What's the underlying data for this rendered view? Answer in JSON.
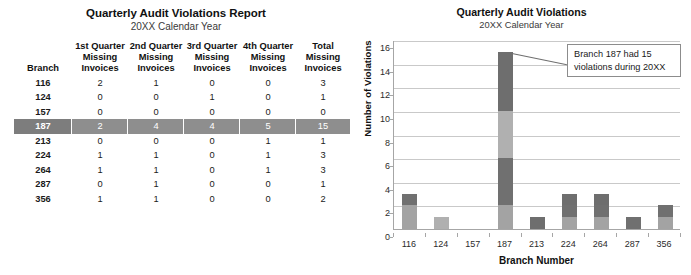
{
  "table_report": {
    "title": "Quarterly Audit Violations Report",
    "subtitle": "20XX Calendar Year",
    "columns": [
      {
        "line1": "",
        "line2": "",
        "line3": "Branch"
      },
      {
        "line1": "1st Quarter",
        "line2": "Missing",
        "line3": "Invoices"
      },
      {
        "line1": "2nd Quarter",
        "line2": "Missing",
        "line3": "Invoices"
      },
      {
        "line1": "3rd Quarter",
        "line2": "Missing",
        "line3": "Invoices"
      },
      {
        "line1": "4th Quarter",
        "line2": "Missing",
        "line3": "Invoices"
      },
      {
        "line1": "Total",
        "line2": "Missing",
        "line3": "Invoices"
      }
    ],
    "rows": [
      {
        "branch": "116",
        "q1": "2",
        "q2": "1",
        "q3": "0",
        "q4": "0",
        "total": "3",
        "highlighted": false
      },
      {
        "branch": "124",
        "q1": "0",
        "q2": "0",
        "q3": "1",
        "q4": "0",
        "total": "1",
        "highlighted": false
      },
      {
        "branch": "157",
        "q1": "0",
        "q2": "0",
        "q3": "0",
        "q4": "0",
        "total": "0",
        "highlighted": false
      },
      {
        "branch": "187",
        "q1": "2",
        "q2": "4",
        "q3": "4",
        "q4": "5",
        "total": "15",
        "highlighted": true
      },
      {
        "branch": "213",
        "q1": "0",
        "q2": "0",
        "q3": "0",
        "q4": "1",
        "total": "1",
        "highlighted": false
      },
      {
        "branch": "224",
        "q1": "1",
        "q2": "1",
        "q3": "0",
        "q4": "1",
        "total": "3",
        "highlighted": false
      },
      {
        "branch": "264",
        "q1": "1",
        "q2": "1",
        "q3": "0",
        "q4": "1",
        "total": "3",
        "highlighted": false
      },
      {
        "branch": "287",
        "q1": "0",
        "q2": "1",
        "q3": "0",
        "q4": "0",
        "total": "1",
        "highlighted": false
      },
      {
        "branch": "356",
        "q1": "1",
        "q2": "1",
        "q3": "0",
        "q4": "0",
        "total": "2",
        "highlighted": false
      }
    ]
  },
  "chart_panel": {
    "title": "Quarterly Audit Violations",
    "subtitle": "20XX Calendar Year",
    "callout": {
      "line1": "Branch 187 had 15",
      "line2": "violations during 20XX"
    }
  },
  "chart_data": {
    "type": "bar",
    "stacked": true,
    "title": "Quarterly Audit Violations",
    "subtitle": "20XX Calendar Year",
    "xlabel": "Branch Number",
    "ylabel": "Number of Violations",
    "categories": [
      "116",
      "124",
      "157",
      "187",
      "213",
      "224",
      "264",
      "287",
      "356"
    ],
    "series": [
      {
        "name": "1st Quarter Missing Invoices",
        "color": "#a3a3a3",
        "values": [
          2,
          0,
          0,
          2,
          0,
          1,
          1,
          0,
          1
        ]
      },
      {
        "name": "2nd Quarter Missing Invoices",
        "color": "#707070",
        "values": [
          1,
          0,
          0,
          4,
          0,
          1,
          1,
          1,
          1
        ]
      },
      {
        "name": "3rd Quarter Missing Invoices",
        "color": "#b0b0b0",
        "values": [
          0,
          1,
          0,
          4,
          0,
          0,
          0,
          0,
          0
        ]
      },
      {
        "name": "4th Quarter Missing Invoices",
        "color": "#6e6e6e",
        "values": [
          0,
          0,
          0,
          5,
          1,
          1,
          1,
          0,
          0
        ]
      }
    ],
    "totals": [
      3,
      1,
      0,
      15,
      1,
      3,
      3,
      1,
      2
    ],
    "ylim": [
      0,
      16
    ],
    "yticks": [
      0,
      2,
      4,
      6,
      8,
      10,
      12,
      14,
      16
    ],
    "grid": true,
    "legend": "none",
    "annotations": [
      {
        "text": "Branch 187 had 15 violations during 20XX",
        "target_category": "187",
        "target_value": 15
      }
    ]
  }
}
